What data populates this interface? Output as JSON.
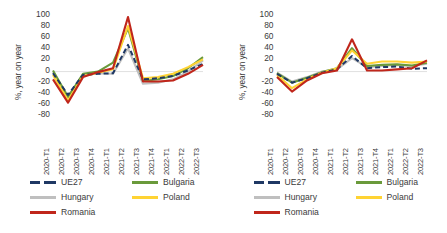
{
  "panels": [
    {
      "id": "left",
      "ylabel": "%, year on year",
      "yticks": [
        "100",
        "80",
        "60",
        "40",
        "20",
        "0",
        "-20",
        "-40",
        "-60",
        "-80"
      ],
      "legend": [
        {
          "label": "UE27",
          "color": "#1f3864",
          "dashed": true
        },
        {
          "label": "Bulgaria",
          "color": "#6a9a3b",
          "dashed": false
        },
        {
          "label": "Hungary",
          "color": "#bfbfbf",
          "dashed": false
        },
        {
          "label": "Poland",
          "color": "#ffd333",
          "dashed": false
        },
        {
          "label": "Romania",
          "color": "#c0261b",
          "dashed": false
        }
      ]
    },
    {
      "id": "right",
      "ylabel": "%, year on year",
      "yticks": [
        "100",
        "80",
        "60",
        "40",
        "20",
        "0",
        "-20",
        "-40",
        "-60",
        "-80"
      ],
      "legend": [
        {
          "label": "UE27",
          "color": "#1f3864",
          "dashed": true
        },
        {
          "label": "Bulgaria",
          "color": "#6a9a3b",
          "dashed": false
        },
        {
          "label": "Hungary",
          "color": "#bfbfbf",
          "dashed": false
        },
        {
          "label": "Poland",
          "color": "#ffd333",
          "dashed": false
        },
        {
          "label": "Romania",
          "color": "#c0261b",
          "dashed": false
        }
      ]
    }
  ],
  "chart_data": [
    {
      "type": "line",
      "title": "",
      "xlabel": "",
      "ylabel": "%, year on year",
      "ylim": [
        -80,
        100
      ],
      "ytick_step": 20,
      "grid": false,
      "legend_position": "bottom",
      "categories": [
        "2020-T1",
        "2020-T2",
        "2020-T3",
        "2020-T4",
        "2021-T1",
        "2021-T2",
        "2021-T3",
        "2021-T4",
        "2022-T1",
        "2022-T2",
        "2022-T3"
      ],
      "series": [
        {
          "name": "UE27",
          "color": "#1f3864",
          "dash": true,
          "values": [
            -3,
            -42,
            -6,
            -4,
            -3,
            48,
            -14,
            -12,
            -8,
            2,
            14
          ]
        },
        {
          "name": "Bulgaria",
          "color": "#6a9a3b",
          "values": [
            2,
            -46,
            -4,
            0,
            16,
            78,
            -17,
            -14,
            -8,
            6,
            26
          ]
        },
        {
          "name": "Hungary",
          "color": "#bfbfbf",
          "values": [
            -1,
            -44,
            -7,
            -3,
            -4,
            42,
            -22,
            -20,
            -14,
            0,
            20
          ]
        },
        {
          "name": "Poland",
          "color": "#ffd333",
          "values": [
            -6,
            -52,
            -8,
            -2,
            4,
            82,
            -12,
            -10,
            -4,
            8,
            22
          ]
        },
        {
          "name": "Romania",
          "color": "#c0261b",
          "values": [
            -14,
            -56,
            -10,
            -1,
            6,
            98,
            -18,
            -18,
            -16,
            -4,
            12
          ]
        }
      ]
    },
    {
      "type": "line",
      "title": "",
      "xlabel": "",
      "ylabel": "%, year on year",
      "ylim": [
        -80,
        100
      ],
      "ytick_step": 20,
      "grid": false,
      "legend_position": "bottom",
      "categories": [
        "2020-T1",
        "2020-T2",
        "2020-T3",
        "2020-T4",
        "2021-T1",
        "2021-T2",
        "2021-T3",
        "2021-T4",
        "2022-T1",
        "2022-T2",
        "2022-T3"
      ],
      "series": [
        {
          "name": "UE27",
          "color": "#1f3864",
          "dash": true,
          "values": [
            -4,
            -20,
            -12,
            -2,
            4,
            28,
            6,
            8,
            9,
            5,
            6
          ]
        },
        {
          "name": "Bulgaria",
          "color": "#6a9a3b",
          "values": [
            -3,
            -20,
            -11,
            -1,
            6,
            42,
            10,
            12,
            13,
            11,
            16
          ]
        },
        {
          "name": "Hungary",
          "color": "#bfbfbf",
          "values": [
            -2,
            -18,
            -10,
            0,
            4,
            24,
            8,
            10,
            12,
            10,
            14
          ]
        },
        {
          "name": "Poland",
          "color": "#ffd333",
          "values": [
            -6,
            -30,
            -14,
            -2,
            6,
            38,
            14,
            18,
            18,
            16,
            18
          ]
        },
        {
          "name": "Romania",
          "color": "#c0261b",
          "values": [
            -10,
            -36,
            -16,
            -3,
            2,
            58,
            2,
            2,
            4,
            6,
            20
          ]
        }
      ]
    }
  ]
}
